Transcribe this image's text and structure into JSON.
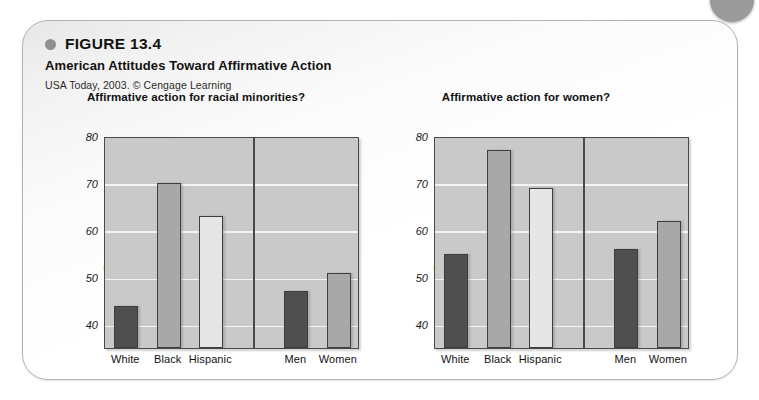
{
  "figure": {
    "bullet_icon": "filled-circle-icon",
    "number": "FIGURE 13.4",
    "title": "American Attitudes Toward Affirmative Action",
    "source": "USA Today, 2003. © Cengage Learning"
  },
  "decoration": {
    "corner_dot_icon": "corner-circle-icon",
    "corner_dot_color": "#9a9a9a",
    "panel_border_color": "#b2b2b2"
  },
  "palette": {
    "plot_background": "#c9c9c9",
    "gridline": "#f4f4f4",
    "axis": "#4a4a4a",
    "bar_dark": "#4f4f4f",
    "bar_mid": "#a8a8a8",
    "bar_light": "#e6e6e6"
  },
  "chart_data": [
    {
      "type": "bar",
      "title": "Affirmative action for racial minorities?",
      "xlabel": "",
      "ylabel": "Percentage agreement",
      "ylim": [
        35,
        80
      ],
      "yticks": [
        40,
        50,
        60,
        70,
        80
      ],
      "ytick_labels": [
        "40",
        "50",
        "60",
        "70",
        "80"
      ],
      "grid": true,
      "legend": "none",
      "group_divider_after": 3,
      "categories": [
        "White",
        "Black",
        "Hispanic",
        "Men",
        "Women"
      ],
      "values": [
        44,
        70,
        63,
        47,
        51
      ],
      "bar_shades": [
        "dark",
        "mid",
        "light",
        "dark",
        "mid"
      ]
    },
    {
      "type": "bar",
      "title": "Affirmative action for women?",
      "xlabel": "",
      "ylabel": "Percentage agreement",
      "ylim": [
        35,
        80
      ],
      "yticks": [
        40,
        50,
        60,
        70,
        80
      ],
      "ytick_labels": [
        "40",
        "50",
        "60",
        "70",
        "80"
      ],
      "grid": true,
      "legend": "none",
      "group_divider_after": 3,
      "categories": [
        "White",
        "Black",
        "Hispanic",
        "Men",
        "Women"
      ],
      "values": [
        55,
        77,
        69,
        56,
        62
      ],
      "bar_shades": [
        "dark",
        "mid",
        "light",
        "dark",
        "mid"
      ]
    }
  ]
}
